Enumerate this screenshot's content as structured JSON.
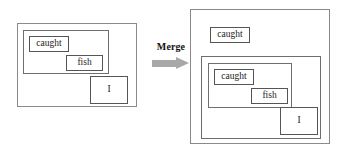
{
  "figure": {
    "type": "nested-box-merge-diagram",
    "operator": {
      "label": "Merge",
      "arrow_icon": "right-arrow-icon",
      "arrow_color": "#a8a8a8"
    },
    "colors": {
      "background": "#ffffff",
      "outer_border": "#8a8a8a",
      "container_border": "#6e6e6e",
      "leaf_border": "#555555",
      "text": "#1a1a1a"
    },
    "left": {
      "name": "before-merge-structure",
      "outer_label": "",
      "container_label": "",
      "nodes": {
        "caught": "caught",
        "fish": "fish",
        "i": "I"
      }
    },
    "right": {
      "name": "after-merge-structure",
      "outer_label": "",
      "container_label": "",
      "nodes": {
        "caught_top": "caught",
        "caught_inner": "caught",
        "fish": "fish",
        "i": "I"
      }
    }
  }
}
